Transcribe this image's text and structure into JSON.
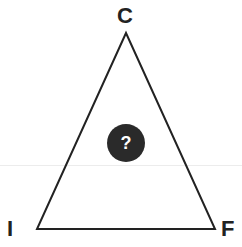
{
  "diagram": {
    "type": "triangle",
    "vertices": {
      "top": {
        "label": "C"
      },
      "bottom_left": {
        "label": "I"
      },
      "bottom_right": {
        "label": "F"
      }
    },
    "center_badge": {
      "label": "?",
      "icon": "question-mark-icon"
    },
    "colors": {
      "stroke": "#222222",
      "badge_fill": "#2a2a2a",
      "badge_text": "#ffffff",
      "background": "#ffffff"
    }
  }
}
